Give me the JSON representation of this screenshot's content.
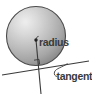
{
  "figure": {
    "background_color": "#ffffff",
    "width": 92,
    "height": 96
  },
  "labels": {
    "radius": "radius",
    "tangent": "tangent"
  },
  "colors": {
    "sphere_highlight": "#e8e8e8",
    "sphere_mid": "#b4b4b4",
    "sphere_shadow": "#8f8f8f",
    "sphere_outline": "#4a4a4a",
    "line": "#3a3a3a",
    "text": "#3a3a3a"
  },
  "geometry": {
    "circle": {
      "cx": 36,
      "cy": 36,
      "r": 30
    },
    "center_dot": {
      "cx": 36,
      "cy": 40,
      "r": 1.6
    },
    "radius_line": {
      "x1": 36,
      "y1": 40,
      "x2": 41,
      "y2": 94
    },
    "tangent_line": {
      "x1": 2,
      "y1": 75,
      "x2": 89,
      "y2": 61
    },
    "right_angle_marker": {
      "x": 36,
      "y": 62,
      "size": 5
    },
    "tangent_point": {
      "x": 38,
      "y": 66
    }
  },
  "label_positions": {
    "radius": {
      "x": 39,
      "y": 45
    },
    "tangent": {
      "x": 57,
      "y": 79
    }
  }
}
